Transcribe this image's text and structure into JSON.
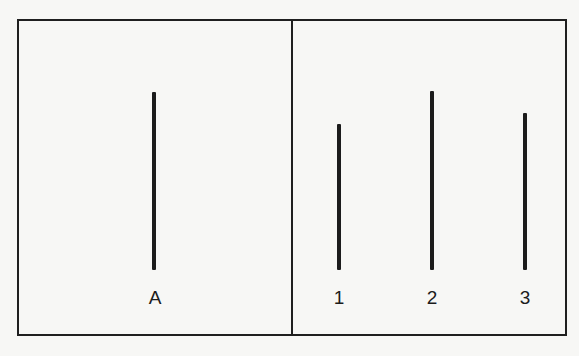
{
  "diagram": {
    "title": "",
    "panels": [
      {
        "name": "standard",
        "lines": [
          {
            "label": "A",
            "x": 154,
            "y_top": 92,
            "y_bottom": 270
          }
        ]
      },
      {
        "name": "comparison",
        "lines": [
          {
            "label": "1",
            "x": 339,
            "y_top": 124,
            "y_bottom": 270
          },
          {
            "label": "2",
            "x": 432,
            "y_top": 91,
            "y_bottom": 270
          },
          {
            "label": "3",
            "x": 525,
            "y_top": 113,
            "y_bottom": 270
          }
        ]
      }
    ],
    "colors": {
      "line": "#1c1c1c",
      "border": "#1f1f1f",
      "background": "#f7f7f5"
    }
  }
}
